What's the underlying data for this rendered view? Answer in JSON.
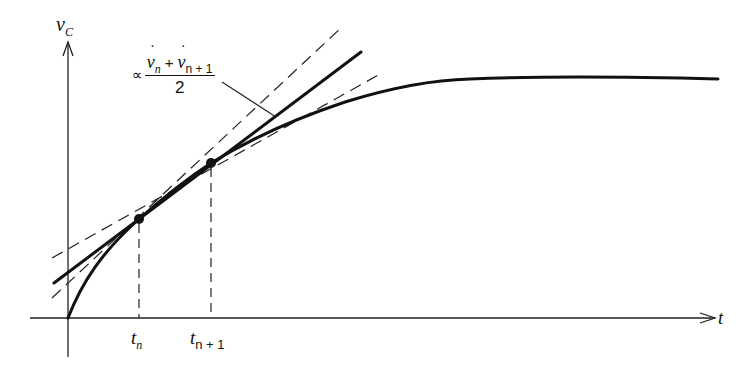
{
  "diagram": {
    "title": "",
    "y_axis": {
      "label": "v",
      "label_subscript": "C"
    },
    "x_axis": {
      "label": "t"
    },
    "ticks": [
      {
        "label": "t",
        "subscript": "n"
      },
      {
        "label": "t",
        "subscript": "n + 1"
      }
    ],
    "annotation": {
      "prefix": "∝",
      "numerator_left": "v",
      "numerator_left_sub": "n",
      "operator": "+",
      "numerator_right": "v",
      "numerator_right_sub": "n + 1",
      "denominator": "2"
    },
    "elements": [
      "capacitor voltage charging curve v_C(t)",
      "tangent at t_n (dashed)",
      "tangent at t_n+1 (dashed)",
      "averaged-slope line (solid) through both points",
      "vertical dashed markers at t_n and t_n+1"
    ],
    "colors": {
      "ink": "#111111",
      "background": "#ffffff"
    }
  }
}
